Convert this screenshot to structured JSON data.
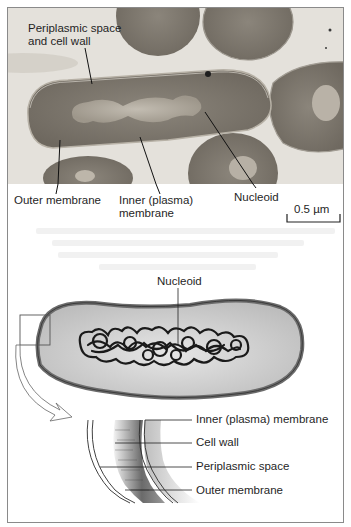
{
  "figure": {
    "micrograph": {
      "labels": {
        "periplasmic_space_line1": "Periplasmic space",
        "periplasmic_space_line2": "and cell wall",
        "outer_membrane": "Outer membrane",
        "inner_membrane_line1": "Inner (plasma)",
        "inner_membrane_line2": "membrane",
        "nucleoid": "Nucleoid"
      },
      "scale_bar": "0.5 µm"
    },
    "cell_diagram": {
      "nucleoid_label": "Nucleoid"
    },
    "envelope_detail": {
      "labels": [
        "Inner (plasma) membrane",
        "Cell wall",
        "Periplasmic space",
        "Outer membrane"
      ]
    },
    "colors": {
      "membrane_outline": "#6b6b6b",
      "cell_fill": "#cfcfcf",
      "nucleoid_strand": "#1a1a1a",
      "micrograph_bg": "#e3e0da",
      "bacterium_dense": "#7b756c"
    }
  }
}
